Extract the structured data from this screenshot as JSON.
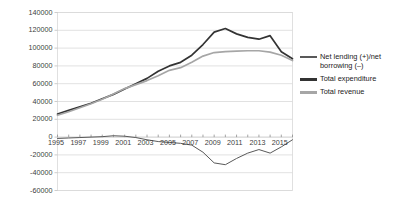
{
  "chart_data": {
    "type": "line",
    "title": "",
    "xlabel": "",
    "ylabel": "",
    "x": [
      1995,
      1996,
      1997,
      1998,
      1999,
      2000,
      2001,
      2002,
      2003,
      2004,
      2005,
      2006,
      2007,
      2008,
      2009,
      2010,
      2011,
      2012,
      2013,
      2014,
      2015,
      2016
    ],
    "xtick_labels": [
      "1995",
      "1997",
      "1999",
      "2001",
      "2003",
      "2005",
      "2007",
      "2009",
      "2011",
      "2013",
      "2015"
    ],
    "xtick_values": [
      1995,
      1997,
      1999,
      2001,
      2003,
      2005,
      2007,
      2009,
      2011,
      2013,
      2015
    ],
    "ytick_labels": [
      "140000",
      "120000",
      "100000",
      "80000",
      "60000",
      "40000",
      "20000",
      "0",
      "-20000",
      "-40000",
      "-60000"
    ],
    "ytick_values": [
      140000,
      120000,
      100000,
      80000,
      60000,
      40000,
      20000,
      0,
      -20000,
      -40000,
      -60000
    ],
    "ylim": [
      -60000,
      140000
    ],
    "grid": true,
    "legend_position": "right",
    "series": [
      {
        "name": "Net lending (+)/net borrowing (–)",
        "color": "#595959",
        "values": [
          -1500,
          -1000,
          -500,
          0,
          500,
          1500,
          1000,
          -500,
          -3000,
          -5000,
          -6000,
          -7000,
          -9000,
          -17000,
          -29000,
          -31000,
          -24000,
          -18000,
          -14000,
          -18000,
          -11000,
          -3000
        ]
      },
      {
        "name": "Total expenditure",
        "color": "#333333",
        "values": [
          26000,
          30000,
          34000,
          38000,
          43000,
          48000,
          54000,
          60000,
          66000,
          74000,
          80000,
          84000,
          92000,
          104000,
          118000,
          122000,
          116000,
          112000,
          110000,
          114000,
          96000,
          88000
        ]
      },
      {
        "name": "Total revenue",
        "color": "#a6a6a6",
        "values": [
          24500,
          28500,
          33000,
          37500,
          42500,
          48500,
          54500,
          59000,
          63500,
          69000,
          75000,
          78000,
          84000,
          91000,
          95000,
          96000,
          96500,
          97000,
          97000,
          95500,
          92000,
          86000
        ]
      }
    ]
  }
}
